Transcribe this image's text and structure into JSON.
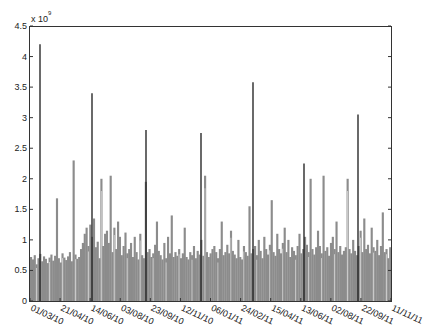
{
  "chart_data": {
    "type": "bar",
    "title": "",
    "xlabel": "",
    "ylabel": "",
    "y_multiplier_label": "x 10",
    "y_multiplier_exponent": "9",
    "ylim": [
      0,
      4.5
    ],
    "yticks": [
      0,
      0.5,
      1,
      1.5,
      2,
      2.5,
      3,
      3.5,
      4,
      4.5
    ],
    "ytick_labels": [
      "0",
      "0.5",
      "1",
      "1.5",
      "2",
      "2.5",
      "3",
      "3.5",
      "4",
      "4.5"
    ],
    "xtick_labels": [
      "01/03/10",
      "21/04/10",
      "14/06/10",
      "03/08/10",
      "23/09/10",
      "12/11/10",
      "06/01/11",
      "24/02/11",
      "15/04/11",
      "13/06/11",
      "02/08/11",
      "22/09/11",
      "11/11/11"
    ],
    "grid": false,
    "legend": null,
    "colors": {
      "bars": "#8c8c8c",
      "gaps": "#d9d9d9",
      "spikes": "#1a1a1a",
      "axes": "#333333"
    },
    "spikes": [
      {
        "date_approx": "10/03/10",
        "value": 4.2
      },
      {
        "date_approx": "05/06/10",
        "value": 3.4
      },
      {
        "date_approx": "25/08/10",
        "value": 2.8
      },
      {
        "date_approx": "17/11/10",
        "value": 2.75
      },
      {
        "date_approx": "05/02/11",
        "value": 3.58
      },
      {
        "date_approx": "26/04/11",
        "value": 2.25
      },
      {
        "date_approx": "14/07/11",
        "value": 3.05
      }
    ],
    "series": [
      {
        "name": "daily volume",
        "values": [
          0.72,
          0.68,
          0.75,
          0.6,
          0.7,
          0.77,
          0.65,
          0.73,
          0.69,
          0.62,
          0.71,
          0.76,
          0.66,
          0.74,
          1.68,
          0.7,
          0.63,
          0.78,
          0.71,
          0.67,
          0.73,
          0.8,
          0.65,
          2.3,
          0.76,
          0.69,
          0.72,
          0.85,
          0.95,
          1.1,
          1.2,
          0.9,
          1.25,
          1.05,
          1.35,
          0.88,
          0.97,
          0.7,
          2.0,
          0.9,
          1.1,
          1.15,
          0.95,
          2.05,
          0.8,
          1.2,
          0.85,
          1.3,
          1.05,
          0.75,
          0.9,
          1.12,
          0.78,
          0.85,
          0.95,
          0.72,
          1.05,
          0.8,
          0.68,
          1.1,
          0.75,
          0.7,
          1.95,
          0.8,
          0.85,
          0.72,
          0.78,
          0.92,
          1.3,
          0.82,
          0.75,
          0.68,
          0.95,
          0.7,
          1.05,
          0.78,
          1.4,
          0.72,
          0.8,
          0.74,
          0.85,
          0.7,
          0.78,
          1.2,
          0.72,
          0.68,
          0.8,
          0.75,
          0.9,
          0.7,
          0.82,
          0.76,
          1.0,
          0.74,
          2.05,
          0.8,
          0.72,
          0.78,
          0.85,
          0.9,
          0.8,
          0.7,
          0.85,
          1.3,
          0.75,
          0.8,
          0.92,
          0.78,
          1.15,
          0.82,
          0.76,
          0.7,
          1.0,
          0.72,
          0.68,
          0.9,
          0.8,
          0.74,
          1.55,
          0.78,
          0.85,
          0.9,
          0.75,
          1.0,
          0.82,
          0.7,
          1.05,
          0.85,
          0.76,
          0.92,
          1.65,
          0.8,
          0.74,
          1.1,
          0.85,
          0.78,
          0.95,
          1.2,
          0.8,
          1.0,
          0.72,
          0.88,
          0.82,
          0.75,
          0.9,
          1.1,
          0.78,
          0.85,
          1.05,
          0.92,
          0.8,
          2.0,
          0.85,
          0.76,
          0.88,
          1.15,
          0.9,
          0.78,
          2.05,
          0.82,
          0.88,
          0.74,
          0.95,
          1.05,
          0.85,
          1.3,
          0.8,
          0.9,
          0.76,
          0.82,
          0.88,
          2.0,
          0.85,
          0.78,
          1.0,
          0.82,
          0.75,
          0.9,
          1.15,
          0.8,
          1.35,
          0.85,
          0.92,
          0.78,
          1.2,
          0.88,
          0.82,
          1.0,
          0.75,
          0.9,
          1.45,
          0.8,
          0.85,
          0.7,
          0.88
        ]
      }
    ]
  }
}
